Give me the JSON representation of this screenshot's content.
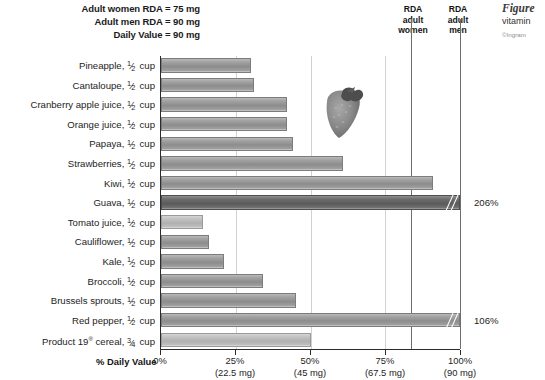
{
  "header": {
    "notes": [
      "Adult women RDA = 75 mg",
      "Adult men RDA = 90 mg",
      "Daily Value = 90 mg"
    ]
  },
  "caption": {
    "title": "Figure",
    "subtitle": "vitamin",
    "credit": "©Ingram"
  },
  "markers": [
    {
      "name": "rda-adult-women",
      "label": "RDA\nadult\nwomen",
      "line1": "RDA",
      "line2": "adult",
      "line3": "women",
      "percent": 83.3,
      "mg": 75
    },
    {
      "name": "rda-adult-men",
      "label": "RDA\nadult\nmen",
      "line1": "RDA",
      "line2": "adult",
      "line3": "men",
      "percent": 100,
      "mg": 90
    }
  ],
  "axis": {
    "title": "% Daily Value",
    "ticks": [
      {
        "pct": "0%",
        "mg": ""
      },
      {
        "pct": "25%",
        "mg": "(22.5 mg)"
      },
      {
        "pct": "50%",
        "mg": "(45 mg)"
      },
      {
        "pct": "75%",
        "mg": "(67.5 mg)"
      },
      {
        "pct": "100%",
        "mg": "(90 mg)"
      }
    ]
  },
  "overflow_labels": {
    "guava": "206%",
    "red_pepper": "106%"
  },
  "photo": {
    "name": "strawberry-photo",
    "alt": "strawberry"
  },
  "chart_data": {
    "type": "bar",
    "orientation": "horizontal",
    "xlabel": "% Daily Value",
    "ylabel": "",
    "xlim": [
      0,
      100
    ],
    "grid": true,
    "legend": null,
    "categories": [
      "Pineapple, ½ cup",
      "Cantaloupe, ½ cup",
      "Cranberry apple juice, ½ cup",
      "Orange juice, ½ cup",
      "Papaya, ½ cup",
      "Strawberries, ½ cup",
      "Kiwi, ½ cup",
      "Guava, ½ cup",
      "Tomato juice, ½ cup",
      "Cauliflower, ½ cup",
      "Kale, ½ cup",
      "Broccoli, ½ cup",
      "Brussels sprouts, ½ cup",
      "Red pepper, ½ cup",
      "Product 19® cereal, ¾ cup"
    ],
    "values": [
      30,
      31,
      42,
      42,
      44,
      61,
      91,
      206,
      14,
      16,
      21,
      34,
      45,
      106,
      50
    ],
    "annotations": [
      {
        "category": "Guava, ½ cup",
        "text": "206%",
        "note": "axis break, bar exceeds 100% scale"
      },
      {
        "category": "Red pepper, ½ cup",
        "text": "106%",
        "note": "axis break, bar exceeds 100% scale"
      }
    ],
    "reference_lines": [
      {
        "label": "RDA adult women",
        "value": 83.3
      },
      {
        "label": "RDA adult men",
        "value": 100
      }
    ]
  },
  "rows": [
    {
      "name": "pineapple",
      "label_main": "Pineapple, ",
      "unit": "cup",
      "num": "1",
      "den": "2",
      "value": 30,
      "shade": "mid"
    },
    {
      "name": "cantaloupe",
      "label_main": "Cantaloupe, ",
      "unit": "cup",
      "num": "1",
      "den": "2",
      "value": 31,
      "shade": "mid"
    },
    {
      "name": "cranberry-apple-juice",
      "label_main": "Cranberry apple juice, ",
      "unit": "cup",
      "num": "1",
      "den": "2",
      "value": 42,
      "shade": "mid"
    },
    {
      "name": "orange-juice",
      "label_main": "Orange juice, ",
      "unit": "cup",
      "num": "1",
      "den": "2",
      "value": 42,
      "shade": "mid"
    },
    {
      "name": "papaya",
      "label_main": "Papaya, ",
      "unit": "cup",
      "num": "1",
      "den": "2",
      "value": 44,
      "shade": "mid"
    },
    {
      "name": "strawberries",
      "label_main": "Strawberries, ",
      "unit": "cup",
      "num": "1",
      "den": "2",
      "value": 61,
      "shade": "mid"
    },
    {
      "name": "kiwi",
      "label_main": "Kiwi, ",
      "unit": "cup",
      "num": "1",
      "den": "2",
      "value": 91,
      "shade": "mid"
    },
    {
      "name": "guava",
      "label_main": "Guava, ",
      "unit": "cup",
      "num": "1",
      "den": "2",
      "value": 206,
      "shade": "dark"
    },
    {
      "name": "tomato-juice",
      "label_main": "Tomato juice, ",
      "unit": "cup",
      "num": "1",
      "den": "2",
      "value": 14,
      "shade": "light"
    },
    {
      "name": "cauliflower",
      "label_main": "Cauliflower, ",
      "unit": "cup",
      "num": "1",
      "den": "2",
      "value": 16,
      "shade": "mid"
    },
    {
      "name": "kale",
      "label_main": "Kale, ",
      "unit": "cup",
      "num": "1",
      "den": "2",
      "value": 21,
      "shade": "mid"
    },
    {
      "name": "broccoli",
      "label_main": "Broccoli, ",
      "unit": "cup",
      "num": "1",
      "den": "2",
      "value": 34,
      "shade": "mid"
    },
    {
      "name": "brussels-sprouts",
      "label_main": "Brussels sprouts, ",
      "unit": "cup",
      "num": "1",
      "den": "2",
      "value": 45,
      "shade": "mid"
    },
    {
      "name": "red-pepper",
      "label_main": "Red pepper, ",
      "unit": "cup",
      "num": "1",
      "den": "2",
      "value": 106,
      "shade": "mid"
    },
    {
      "name": "product-19-cereal",
      "label_main": "Product 19® cereal, ",
      "unit": "cup",
      "num": "3",
      "den": "4",
      "value": 50,
      "shade": "light"
    }
  ]
}
